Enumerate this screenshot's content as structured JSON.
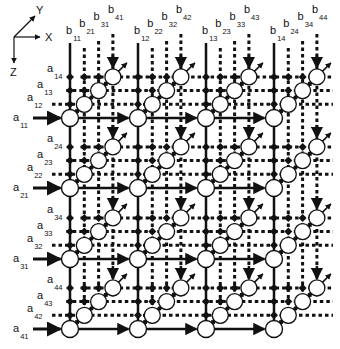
{
  "axes": {
    "x_label": "X",
    "y_label": "Y",
    "z_label": "Z"
  },
  "grid": {
    "rows": 4,
    "cols": 4,
    "sub_nodes_per_cell": 3
  },
  "row_inputs": [
    [
      "a11",
      "a12",
      "a13",
      "a14"
    ],
    [
      "a21",
      "a22",
      "a23",
      "a24"
    ],
    [
      "a31",
      "a32",
      "a33",
      "a34"
    ],
    [
      "a41",
      "a42",
      "a43",
      "a44"
    ]
  ],
  "col_inputs": [
    [
      "b11",
      "b21",
      "b31",
      "b41"
    ],
    [
      "b12",
      "b22",
      "b32",
      "b42"
    ],
    [
      "b13",
      "b23",
      "b33",
      "b43"
    ],
    [
      "b14",
      "b24",
      "b34",
      "b44"
    ]
  ],
  "colors": {
    "stroke": "#111111",
    "node_fill": "#ffffff",
    "background": "#ffffff"
  }
}
